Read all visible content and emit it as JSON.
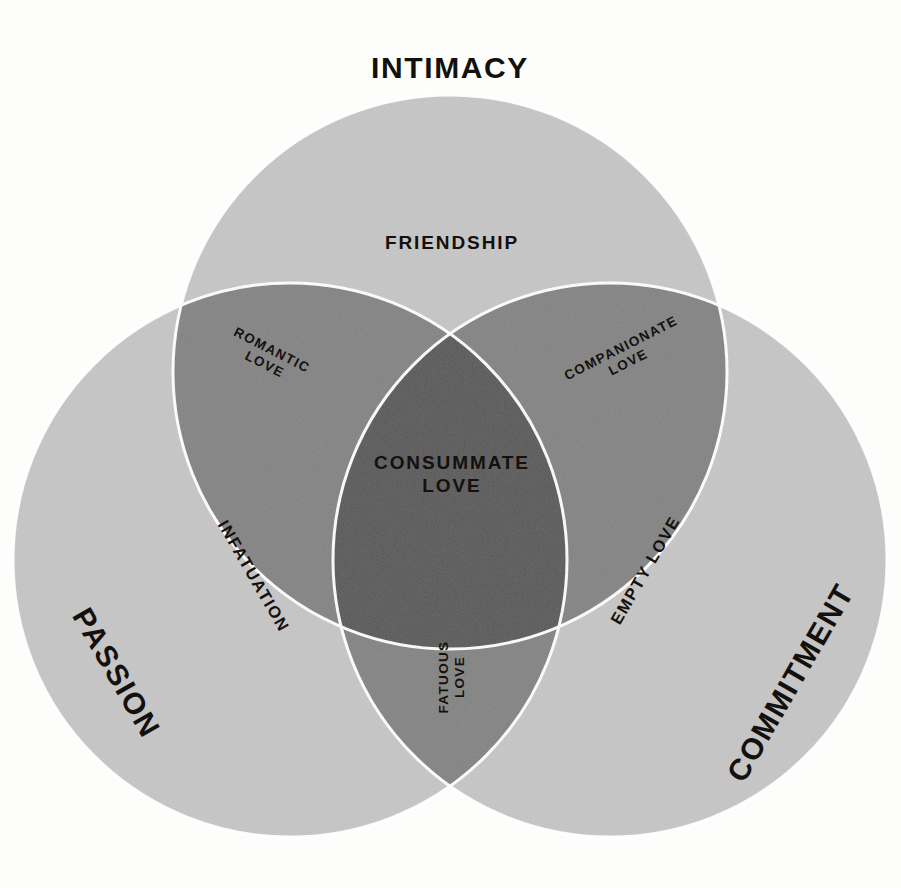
{
  "diagram": {
    "title_semantic": "sternberg-triangular-theory-of-love",
    "type": "venn-3-circle",
    "background_color": "#fdfdfc",
    "text_color": "#14100d",
    "region_colors": {
      "single": "#c6c6c6",
      "double": "#828282",
      "triple": "#555555",
      "separator": "#ffffff"
    }
  },
  "outer_labels": [
    {
      "id": "intimacy",
      "text": "INTIMACY",
      "x": 450,
      "y": 68,
      "rotate": 0
    },
    {
      "id": "passion",
      "text": "PASSION",
      "x": 116,
      "y": 673,
      "rotate": 60
    },
    {
      "id": "commitment",
      "text": "COMMITMENT",
      "x": 791,
      "y": 683,
      "rotate": -60
    }
  ],
  "circles": [
    {
      "id": "intimacy-circle",
      "label": "INTIMACY",
      "cx": 450,
      "cy": 372,
      "r": 277
    },
    {
      "id": "passion-circle",
      "label": "PASSION",
      "cx": 290,
      "cy": 560,
      "r": 277
    },
    {
      "id": "commitment-circle",
      "label": "COMMITMENT",
      "cx": 610,
      "cy": 560,
      "r": 277
    }
  ],
  "regions": [
    {
      "id": "friendship",
      "text": "FRIENDSHIP",
      "sets": [
        "INTIMACY"
      ],
      "shade": "single",
      "x": 452,
      "y": 243,
      "rotate": 0,
      "size": "inner-major"
    },
    {
      "id": "infatuation",
      "text": "INFATUATION",
      "sets": [
        "PASSION"
      ],
      "shade": "single",
      "x": 254,
      "y": 576,
      "rotate": 60,
      "size": "inner-mid"
    },
    {
      "id": "empty-love",
      "text": "EMPTY LOVE",
      "sets": [
        "COMMITMENT"
      ],
      "shade": "single",
      "x": 645,
      "y": 570,
      "rotate": -60,
      "size": "inner-mid"
    },
    {
      "id": "romantic-love",
      "text": "ROMANTIC\nLOVE",
      "sets": [
        "INTIMACY",
        "PASSION"
      ],
      "shade": "double",
      "x": 268,
      "y": 358,
      "rotate": 27,
      "size": "inner-minor"
    },
    {
      "id": "companionate-love",
      "text": "COMPANIONATE\nLOVE",
      "sets": [
        "INTIMACY",
        "COMMITMENT"
      ],
      "shade": "double",
      "x": 625,
      "y": 356,
      "rotate": -27,
      "size": "inner-minor"
    },
    {
      "id": "fatuous-love",
      "text": "FATUOUS\nLOVE",
      "sets": [
        "PASSION",
        "COMMITMENT"
      ],
      "shade": "double",
      "x": 452,
      "y": 677,
      "rotate": -90,
      "size": "inner-minor"
    },
    {
      "id": "consummate-love",
      "text": "CONSUMMATE\nLOVE",
      "sets": [
        "INTIMACY",
        "PASSION",
        "COMMITMENT"
      ],
      "shade": "triple",
      "x": 452,
      "y": 474,
      "rotate": 0,
      "size": "inner-major"
    }
  ]
}
